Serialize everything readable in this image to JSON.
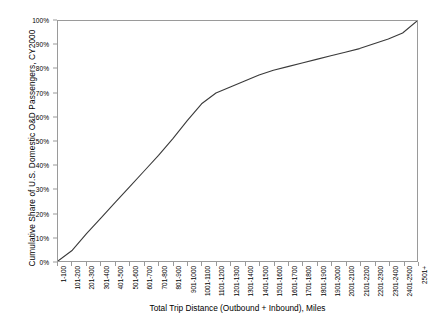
{
  "chart_data": {
    "type": "line",
    "title": "",
    "xlabel": "Total Trip Distance (Outbound + Inbound), Miles",
    "ylabel": "Cumulative Share of U.S. Domestic O&D Passengers, CY2000",
    "ylim": [
      0,
      100
    ],
    "yticks": [
      "0%",
      "10%",
      "20%",
      "30%",
      "40%",
      "50%",
      "60%",
      "70%",
      "80%",
      "90%",
      "100%"
    ],
    "ytick_values": [
      0,
      10,
      20,
      30,
      40,
      50,
      60,
      70,
      80,
      90,
      100
    ],
    "grid": false,
    "legend": "none",
    "line_color": "#3a3a3a",
    "categories": [
      "1-100",
      "101-200",
      "201-300",
      "301-400",
      "401-500",
      "501-600",
      "601-700",
      "701-800",
      "801-900",
      "901-1000",
      "1001-1100",
      "1101-1200",
      "1201-1300",
      "1301-1400",
      "1401-1500",
      "1501-1600",
      "1601-1700",
      "1701-1800",
      "1801-1900",
      "1901-2000",
      "2001-2100",
      "2101-2200",
      "2201-2300",
      "2301-2400",
      "2401-2500",
      "2501+"
    ],
    "values": [
      0.0,
      4.5,
      11.5,
      18.0,
      24.5,
      31.0,
      37.5,
      44.0,
      51.0,
      58.5,
      65.5,
      70.0,
      72.5,
      75.0,
      77.5,
      79.5,
      81.0,
      82.5,
      84.0,
      85.5,
      87.0,
      88.5,
      90.5,
      92.5,
      95.0,
      100.0
    ]
  }
}
